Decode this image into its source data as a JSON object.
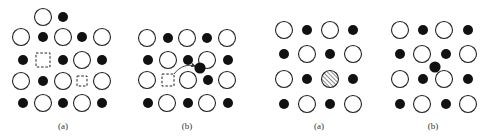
{
  "colors": {
    "ink": "#111111",
    "open_fill": "#ffffff",
    "stroke": "#222222",
    "label": "#333333"
  },
  "sizes": {
    "open_radius": 8.5,
    "dot_radius": 5
  },
  "panels": [
    {
      "id": "panel-1",
      "label": "(a)",
      "label_pos": [
        63,
        129
      ],
      "open": [
        [
          43,
          17
        ],
        [
          21,
          37
        ],
        [
          63,
          37
        ],
        [
          102,
          37
        ],
        [
          82,
          60
        ],
        [
          21,
          81
        ],
        [
          63,
          81
        ],
        [
          102,
          81
        ],
        [
          43,
          103
        ],
        [
          82,
          103
        ]
      ],
      "dots": [
        [
          63,
          17
        ],
        [
          43,
          37
        ],
        [
          82,
          37
        ],
        [
          23,
          60
        ],
        [
          63,
          60
        ],
        [
          102,
          60
        ],
        [
          43,
          81
        ],
        [
          23,
          103
        ],
        [
          63,
          103
        ],
        [
          102,
          103
        ]
      ],
      "vacancies": [
        {
          "x": 43,
          "y": 60,
          "size": 14
        },
        {
          "x": 82,
          "y": 81,
          "size": 10
        }
      ],
      "hatched": [],
      "interstitials": [],
      "arrows": []
    },
    {
      "id": "panel-2",
      "label": "(b)",
      "label_pos": [
        187,
        129
      ],
      "open": [
        [
          147,
          38
        ],
        [
          187,
          38
        ],
        [
          227,
          38
        ],
        [
          168,
          60
        ],
        [
          207,
          60
        ],
        [
          147,
          80
        ],
        [
          188,
          80
        ],
        [
          227,
          80
        ],
        [
          167,
          103
        ],
        [
          207,
          103
        ]
      ],
      "dots": [
        [
          168,
          38
        ],
        [
          207,
          38
        ],
        [
          148,
          60
        ],
        [
          188,
          60
        ],
        [
          228,
          60
        ],
        [
          208,
          80
        ],
        [
          148,
          103
        ],
        [
          188,
          103
        ],
        [
          228,
          103
        ]
      ],
      "vacancies": [
        {
          "x": 168,
          "y": 80,
          "size": 12
        }
      ],
      "hatched": [],
      "interstitials": [
        [
          200,
          68
        ]
      ],
      "arrows": [
        {
          "path": "M 174 74 C 180 66, 188 64, 195 66"
        }
      ]
    },
    {
      "id": "panel-3",
      "label": "(a)",
      "label_pos": [
        319,
        129
      ],
      "open": [
        [
          284,
          30
        ],
        [
          330,
          30
        ],
        [
          307,
          54
        ],
        [
          353,
          54
        ],
        [
          284,
          79
        ],
        [
          307,
          104
        ],
        [
          353,
          104
        ]
      ],
      "dots": [
        [
          307,
          30
        ],
        [
          353,
          30
        ],
        [
          284,
          54
        ],
        [
          330,
          54
        ],
        [
          307,
          79
        ],
        [
          353,
          79
        ],
        [
          284,
          104
        ],
        [
          330,
          104
        ]
      ],
      "vacancies": [],
      "hatched": [
        [
          330,
          79
        ]
      ],
      "interstitials": [],
      "arrows": []
    },
    {
      "id": "panel-4",
      "label": "(b)",
      "label_pos": [
        433,
        129
      ],
      "open": [
        [
          400,
          30
        ],
        [
          444,
          30
        ],
        [
          422,
          54
        ],
        [
          468,
          54
        ],
        [
          400,
          79
        ],
        [
          444,
          79
        ],
        [
          422,
          104
        ],
        [
          468,
          104
        ]
      ],
      "dots": [
        [
          423,
          30
        ],
        [
          468,
          30
        ],
        [
          400,
          54
        ],
        [
          446,
          54
        ],
        [
          423,
          79
        ],
        [
          468,
          79
        ],
        [
          400,
          104
        ],
        [
          446,
          104
        ]
      ],
      "vacancies": [],
      "hatched": [],
      "interstitials": [
        [
          435,
          67
        ]
      ],
      "arrows": []
    }
  ],
  "legend_semantics": {
    "open": "large ion (open circle)",
    "dots": "small ion (filled circle)",
    "vacancies": "vacancy (dashed square)",
    "hatched": "substituted ion (hatched circle)",
    "interstitials": "interstitial ion (filled circle off-lattice)"
  }
}
